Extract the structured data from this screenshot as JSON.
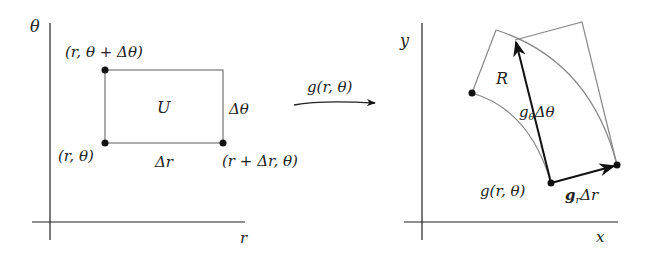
{
  "left_panel": {
    "axis_y_label": "θ",
    "axis_x_label": "r",
    "region_label": "U",
    "corner_top_left": "(r, θ + Δθ)",
    "corner_bottom_left": "(r, θ)",
    "corner_bottom_right": "(r + Δr, θ)",
    "side_right_label": "Δθ",
    "side_bottom_label": "Δr"
  },
  "mapping": {
    "arrow_label": "g(r, θ)"
  },
  "right_panel": {
    "axis_y_label": "y",
    "axis_x_label": "x",
    "region_label": "R",
    "base_point_label": "g(r, θ)",
    "vector_theta_label": "g",
    "vector_theta_sub": "θ",
    "vector_theta_suffix": "Δθ",
    "vector_r_label": "g",
    "vector_r_sub": "r",
    "vector_r_suffix": "Δr"
  },
  "colors": {
    "thin_line": "#777777",
    "thick_line": "#111111",
    "text": "#222222"
  }
}
